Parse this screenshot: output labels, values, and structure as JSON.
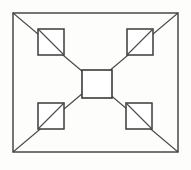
{
  "figure": {
    "background_color": "#fdfdfc",
    "stroke_color": "#3b3b3b",
    "diagonal_color": "#4a4a4a",
    "fill_color": "#ffffff",
    "width": 191,
    "height": 170
  },
  "outer_rectangle": {
    "label": "outer-rectangle",
    "x": 13,
    "y": 13,
    "width": 165,
    "height": 139
  },
  "diagonals": [
    {
      "label": "diagonal-top-left-to-bottom-right",
      "x1": 13,
      "y1": 13,
      "x2": 178,
      "y2": 152
    },
    {
      "label": "diagonal-bottom-left-to-top-right",
      "x1": 13,
      "y1": 152,
      "x2": 178,
      "y2": 13
    }
  ],
  "center_square": {
    "label": "center-square",
    "x": 82,
    "y": 70,
    "width": 30,
    "height": 28
  },
  "corner_squares": [
    {
      "label": "square-top-left",
      "position": "top-left",
      "x": 38,
      "y": 29,
      "width": 26,
      "height": 26
    },
    {
      "label": "square-top-right",
      "position": "top-right",
      "x": 127,
      "y": 29,
      "width": 26,
      "height": 26
    },
    {
      "label": "square-bottom-left",
      "position": "bottom-left",
      "x": 38,
      "y": 103,
      "width": 26,
      "height": 26
    },
    {
      "label": "square-bottom-right",
      "position": "bottom-right",
      "x": 126,
      "y": 103,
      "width": 26,
      "height": 26
    }
  ]
}
